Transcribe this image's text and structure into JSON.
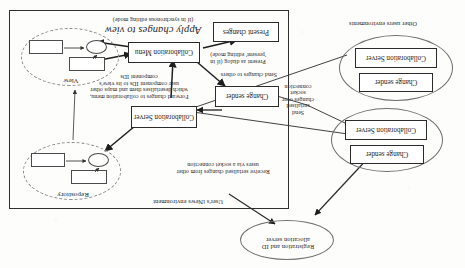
{
  "diagram": {
    "title_visible": false,
    "orientation": "rotated-180",
    "environments": {
      "user_env_label": "User's iNews environment",
      "other_env_label": "Other users environments"
    },
    "nodes": {
      "registration_server": "Registration and ID allocation server",
      "collaboration_server": "Collaboration Server",
      "collaboration_menu": "Collaboration Menu",
      "change_sender": "Change sender",
      "present_changes": "Present changes",
      "repository": "Repository",
      "view": "View",
      "remote_collab_server_1": "Collaboration Server",
      "remote_change_sender_1": "Change sender",
      "remote_collab_server_2": "Collaboration Server",
      "remote_change_sender_2": "Change sender"
    },
    "annotations": {
      "receive_changes": "Receive serialised changes from other users via a socket connection",
      "forward_changes": "Forward changes to collaboration menu, which deserialises them and maps other user component IDs to its view's component IDs",
      "apply_changes_title": "Apply changes to view",
      "apply_changes_sub": "(if in synchronous editing mode)",
      "send_changes_to_others": "Send changes to others",
      "present_as_dialog": "Present as dialog (if in 'present' editing mode)",
      "send_serialised_changes": "Send serialised changes over socket connection"
    }
  }
}
